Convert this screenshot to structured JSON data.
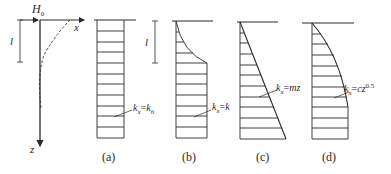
{
  "pile": {
    "load_label": "H",
    "load_sub": "0",
    "x_axis": "x",
    "z_axis": "z",
    "length_label": "l"
  },
  "panels": [
    {
      "caption": "(a)",
      "formula_lhs": "k",
      "formula_lhs_sub": "x",
      "formula_rhs": "k",
      "formula_rhs_sub": "h",
      "formula_eq": "=",
      "shape": "constant"
    },
    {
      "caption": "(b)",
      "formula_lhs": "k",
      "formula_lhs_sub": "x",
      "formula_rhs": "k",
      "formula_eq": "=",
      "length_label": "l",
      "shape": "curved-top-then-constant"
    },
    {
      "caption": "(c)",
      "formula_lhs": "k",
      "formula_lhs_sub": "x",
      "formula_rhs": "mz",
      "formula_eq": "=",
      "shape": "linear"
    },
    {
      "caption": "(d)",
      "formula_lhs": "k",
      "formula_lhs_sub": "x",
      "formula_rhs": "cz",
      "formula_rhs_sup": "0.5",
      "formula_eq": "=",
      "shape": "parabolic"
    }
  ],
  "colors": {
    "line": "#2a2a2a",
    "background": "#ffffff"
  }
}
